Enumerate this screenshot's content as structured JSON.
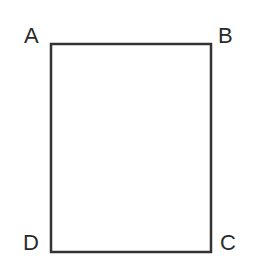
{
  "diagram": {
    "shape": "rectangle",
    "stroke_color": "#333333",
    "vertices": [
      {
        "label": "A",
        "position": "top-left"
      },
      {
        "label": "B",
        "position": "top-right"
      },
      {
        "label": "C",
        "position": "bottom-right"
      },
      {
        "label": "D",
        "position": "bottom-left"
      }
    ]
  }
}
